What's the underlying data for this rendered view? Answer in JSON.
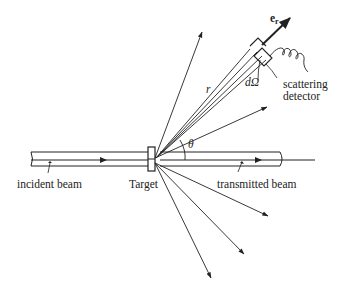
{
  "diagram": {
    "labels": {
      "incident_beam": "incident beam",
      "target": "Target",
      "transmitted_beam": "transmitted beam",
      "theta": "θ",
      "r": "r",
      "d_omega": "dΩ",
      "scattering": "scattering",
      "detector": "detector",
      "e_r": "e",
      "e_r_sub": "r"
    },
    "colors": {
      "line": "#222222",
      "background": "#ffffff"
    }
  }
}
